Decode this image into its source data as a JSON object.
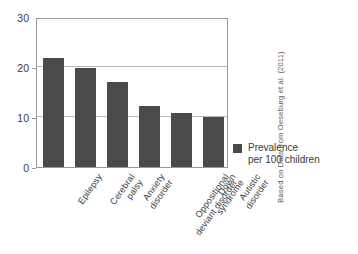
{
  "chart_data": {
    "type": "bar",
    "title": "",
    "subtitle": "",
    "xlabel": "",
    "ylabel": "",
    "ylim": [
      0,
      30
    ],
    "yticks": [
      0,
      10,
      20,
      30
    ],
    "ytick_labels": [
      "0",
      "10",
      "20",
      "30"
    ],
    "grid": true,
    "grid_axis": "y",
    "legend_position": "right",
    "categories": [
      "Epilepsy",
      "Cerebral palsy",
      "Anxiety disorder",
      "Oppositional deviant disorder",
      "Down syndrome",
      "Autistic disorder"
    ],
    "category_labels_wrapped": [
      "Epilepsy",
      "Cerebral\npalsy",
      "Anxiety\ndisorder",
      "Oppositional\ndeviant disorder",
      "Down\nsyndrome",
      "Autistic\ndisorder"
    ],
    "values": [
      21.8,
      19.8,
      17.0,
      12.2,
      10.8,
      10.0
    ],
    "series": [
      {
        "name": "Prevalence per 100 children",
        "values": [
          21.8,
          19.8,
          17.0,
          12.2,
          10.8,
          10.0
        ],
        "color": "#4a4a4a"
      }
    ]
  },
  "legend": {
    "label": "Prevalence\nper 100 children",
    "swatch_color": "#4a4a4a",
    "swatch_icon": "square-swatch-icon"
  },
  "credit": {
    "text": "Based on Data from Oeseburg et al. (2011)"
  },
  "colors": {
    "bar": "#4a4a4a",
    "grid": "#b9b9b9",
    "frame": "#9a9a9a",
    "text": "#3b3b3b",
    "background": "#ffffff"
  }
}
